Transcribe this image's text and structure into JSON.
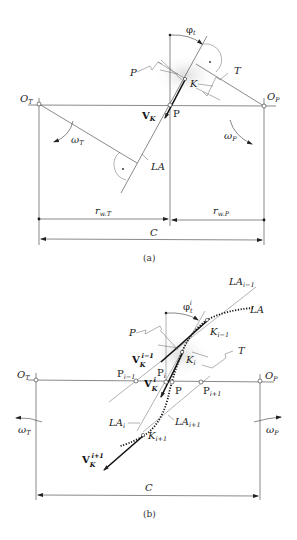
{
  "figure": {
    "panels": [
      {
        "id": "a",
        "caption": "(a)",
        "labels": {
          "O_T": {
            "main": "O",
            "sub": "T"
          },
          "O_P": {
            "main": "O",
            "sub": "P"
          },
          "pitch_point": "P",
          "contact_point": "K",
          "pinion_profile": "P",
          "tool_profile": "T",
          "velocity": {
            "main": "V",
            "sub": "K"
          },
          "angle": {
            "main": "φ",
            "sub": "t"
          },
          "omega_T": {
            "main": "ω",
            "sub": "T"
          },
          "omega_P": {
            "main": "ω",
            "sub": "P"
          },
          "line_of_action": "LA",
          "r_wT": {
            "main": "r",
            "sub": "w.T"
          },
          "r_wP": {
            "main": "r",
            "sub": "w.P"
          },
          "center_distance": "C"
        }
      },
      {
        "id": "b",
        "caption": "(b)",
        "labels": {
          "O_T": {
            "main": "O",
            "sub": "T"
          },
          "O_P": {
            "main": "O",
            "sub": "P"
          },
          "pitch_point": "P",
          "P_im1": {
            "main": "P",
            "sub": "i−1"
          },
          "P_i": {
            "main": "P",
            "sub": "i"
          },
          "P_ip1": {
            "main": "P",
            "sub": "i+1"
          },
          "K_im1": {
            "main": "K",
            "sub": "i−1"
          },
          "K_i": {
            "main": "K",
            "sub": "i"
          },
          "K_ip1": {
            "main": "K",
            "sub": "i+1"
          },
          "pinion_profile": "P",
          "tool_profile": "T",
          "angle": {
            "main": "φ",
            "sub": "t",
            "sup": "i"
          },
          "V_im1": {
            "main": "V",
            "sub": "K",
            "sup": "i−1"
          },
          "V_i": {
            "main": "V",
            "sub": "K",
            "sup": "i"
          },
          "V_ip1": {
            "main": "V",
            "sub": "K",
            "sup": "i+1"
          },
          "LA_im1": {
            "main": "LA",
            "sub": "i−1"
          },
          "LA_i": {
            "main": "LA",
            "sub": "i"
          },
          "LA_ip1": {
            "main": "LA",
            "sub": "i+1"
          },
          "line_of_action": "LA",
          "omega_T": {
            "main": "ω",
            "sub": "T"
          },
          "omega_P": {
            "main": "ω",
            "sub": "P"
          },
          "center_distance": "C"
        }
      }
    ]
  }
}
